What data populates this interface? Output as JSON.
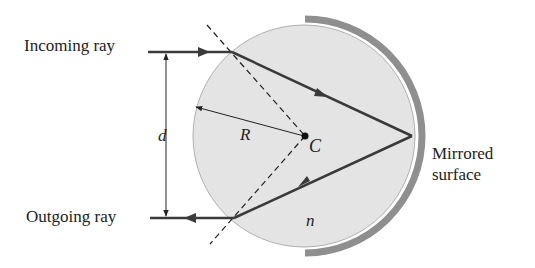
{
  "labels": {
    "incoming": "Incoming ray",
    "outgoing": "Outgoing ray",
    "d": "d",
    "R": "R",
    "C": "C",
    "n": "n",
    "mirror_line1": "Mirrored",
    "mirror_line2": "surface"
  },
  "colors": {
    "sphere_fill": "#e4e4e4",
    "sphere_stroke": "#b0b0b0",
    "mirror": "#8f8f8f",
    "ray": "#3a3a3a",
    "text": "#222222"
  },
  "geometry": {
    "center": [
      304,
      136
    ],
    "radius": 111,
    "incoming_y": 52,
    "outgoing_y": 218
  }
}
